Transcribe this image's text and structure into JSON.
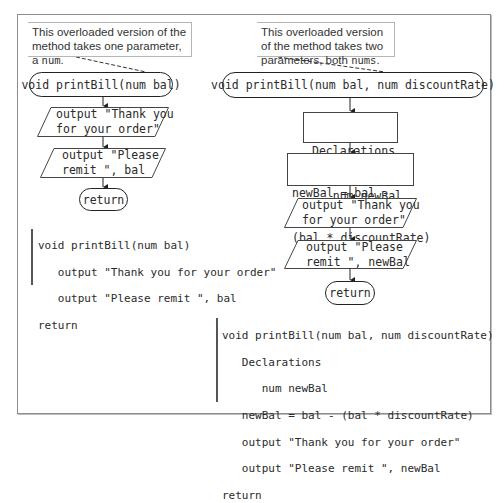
{
  "left": {
    "callout": {
      "text_prefix": "This overloaded version of the method takes one parameter, a ",
      "type_word": "num",
      "text_suffix": "."
    },
    "flowchart": {
      "start": "void printBill(num bal)",
      "output1": [
        "output \"Thank you",
        "for your order\""
      ],
      "output2": [
        "output \"Please",
        "remit \", bal"
      ],
      "end": "return"
    },
    "pseudocode": [
      "void printBill(num bal)",
      "   output \"Thank you for your order\"",
      "   output \"Please remit \", bal",
      "return"
    ]
  },
  "right": {
    "callout": {
      "text_prefix": "This overloaded version of the method takes two parameters, both ",
      "type_word": "nums",
      "text_suffix": "."
    },
    "flowchart": {
      "start": "void printBill(num bal, num discountRate)",
      "declarations": [
        "Declarations",
        "   num newBal"
      ],
      "process": [
        "newBal = bal -",
        "(bal * discountRate)"
      ],
      "output1": [
        "output \"Thank you",
        "for your order\""
      ],
      "output2": [
        "output \"Please",
        "remit \", newBal"
      ],
      "end": "return"
    },
    "pseudocode": [
      "void printBill(num bal, num discountRate)",
      "   Declarations",
      "      num newBal",
      "   newBal = bal - (bal * discountRate)",
      "   output \"Thank you for your order\"",
      "   output \"Please remit \", newBal",
      "return"
    ]
  }
}
